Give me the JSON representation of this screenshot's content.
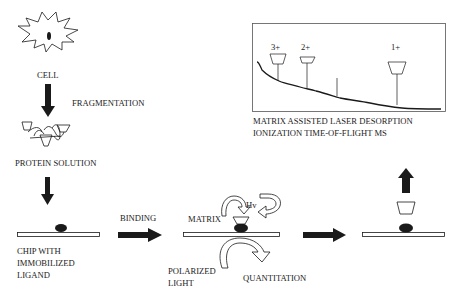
{
  "steps": {
    "cell": {
      "label": "CELL"
    },
    "fragmentation": {
      "label": "FRAGMENTATION"
    },
    "protein_solution": {
      "label": "PROTEIN SOLUTION"
    },
    "chip": {
      "line1": "CHIP WITH",
      "line2": "IMMOBILIZED",
      "line3": "LIGAND"
    },
    "binding": {
      "label": "BINDING"
    },
    "matrix": {
      "label": "MATRIX"
    },
    "hv": {
      "label": "Hv"
    },
    "polarized_light": {
      "line1": "POLARIZED",
      "line2": "LIGHT"
    },
    "quantitation": {
      "label": "QUANTITATION"
    }
  },
  "spectrum": {
    "peaks": [
      {
        "label": "3+"
      },
      {
        "label": "2+"
      },
      {
        "label": "1+"
      }
    ],
    "caption_line1": "MATRIX ASSISTED LASER DESORPTION",
    "caption_line2": "IONIZATION TIME-OF-FLIGHT MS"
  },
  "colors": {
    "ink": "#1a1a1a",
    "background": "#ffffff"
  }
}
